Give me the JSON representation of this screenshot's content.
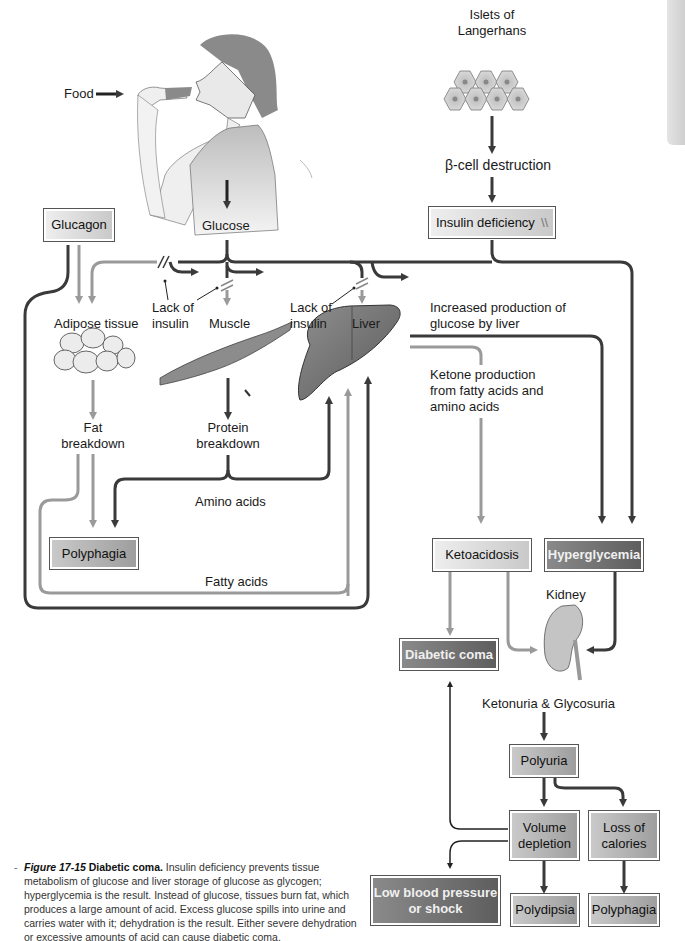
{
  "figure": {
    "number": "Figure 17-15",
    "title": "Diabetic coma.",
    "caption": "Insulin deficiency prevents tissue metabolism of glucose and liver storage of glucose as glycogen; hyperglycemia is the result. Instead of glucose, tissues burn fat, which produces a large amount of acid. Excess glucose spills into urine and carries water with it; dehydration is the result. Either severe dehydration or excessive amounts of acid can cause diabetic coma."
  },
  "labels": {
    "food": "Food",
    "glucose": "Glucose",
    "islets_line1": "Islets of",
    "islets_line2": "Langerhans",
    "beta_cell": "β-cell destruction",
    "lack_insulin_1a": "Lack of",
    "lack_insulin_1b": "insulin",
    "lack_insulin_2a": "Lack of",
    "lack_insulin_2b": "insulin",
    "adipose": "Adipose tissue",
    "muscle": "Muscle",
    "liver": "Liver",
    "fat_breakdown_1": "Fat",
    "fat_breakdown_2": "breakdown",
    "protein_breakdown_1": "Protein",
    "protein_breakdown_2": "breakdown",
    "amino_acids": "Amino acids",
    "fatty_acids": "Fatty acids",
    "inc_glucose_1": "Increased production of",
    "inc_glucose_2": "glucose by liver",
    "ketone_1": "Ketone production",
    "ketone_2": "from fatty acids and",
    "ketone_3": "amino acids",
    "kidney": "Kidney",
    "ketonuria": "Ketonuria & Glycosuria"
  },
  "boxes": {
    "glucagon": "Glucagon",
    "insulin_deficiency": "Insulin deficiency",
    "insulin_deficiency_mark": "\\\\",
    "polyphagia_left": "Polyphagia",
    "ketoacidosis": "Ketoacidosis",
    "hyperglycemia": "Hyperglycemia",
    "diabetic_coma": "Diabetic coma",
    "polyuria": "Polyuria",
    "volume_depletion_1": "Volume",
    "volume_depletion_2": "depletion",
    "loss_calories_1": "Loss of",
    "loss_calories_2": "calories",
    "low_bp_1": "Low blood pressure",
    "low_bp_2": "or shock",
    "polydipsia": "Polydipsia",
    "polyphagia_right": "Polyphagia"
  },
  "colors": {
    "dark_arrow": "#3a3a3a",
    "light_arrow": "#9a9a9a",
    "box_dark": "#6e6e6e",
    "box_medium": "#b0b0b0",
    "box_light": "#dcdcdc"
  }
}
